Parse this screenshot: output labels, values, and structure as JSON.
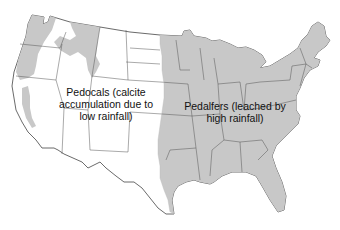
{
  "map": {
    "title": "Soil types of the conterminous United States",
    "regions": [
      {
        "id": "pedocals",
        "label_lines": [
          "Pedocals (calcite",
          "accumulation due to",
          "low rainfall)"
        ],
        "fill": "#ffffff",
        "description": "Western United States, dry climate"
      },
      {
        "id": "pedalfers",
        "label_lines": [
          "Pedalfers (leached by",
          "high rainfall)"
        ],
        "fill": "#c8c8c8",
        "description": "Eastern United States and Pacific Northwest / Rocky Mountain highlands, wet climate"
      }
    ],
    "colors": {
      "background": "#ffffff",
      "pedalfer_fill": "#c8c8c8",
      "state_border": "#555555",
      "coast_outline": "#444444",
      "text": "#111111"
    }
  }
}
